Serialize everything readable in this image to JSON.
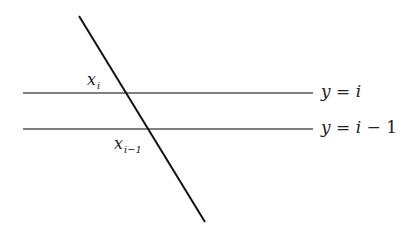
{
  "diagram": {
    "colors": {
      "transversal": "#111111",
      "horizontal": "#555555",
      "text": "#222222"
    },
    "lines": {
      "transversal": {
        "x1": 79,
        "y1": 16,
        "x2": 205,
        "y2": 222
      },
      "horizontal_upper": {
        "x1": 23,
        "y1": 93,
        "x2": 313,
        "y2": 93
      },
      "horizontal_lower": {
        "x1": 23,
        "y1": 129,
        "x2": 313,
        "y2": 129
      }
    },
    "labels": {
      "upper_line": {
        "y": "y",
        "eq": " = ",
        "rhs": "i"
      },
      "lower_line": {
        "y": "y",
        "eq": " = ",
        "rhs_var": "i",
        "rhs_rest": " − 1"
      },
      "upper_point": {
        "base": "x",
        "sub": "i"
      },
      "lower_point": {
        "base": "x",
        "sub": "i−1"
      }
    }
  }
}
